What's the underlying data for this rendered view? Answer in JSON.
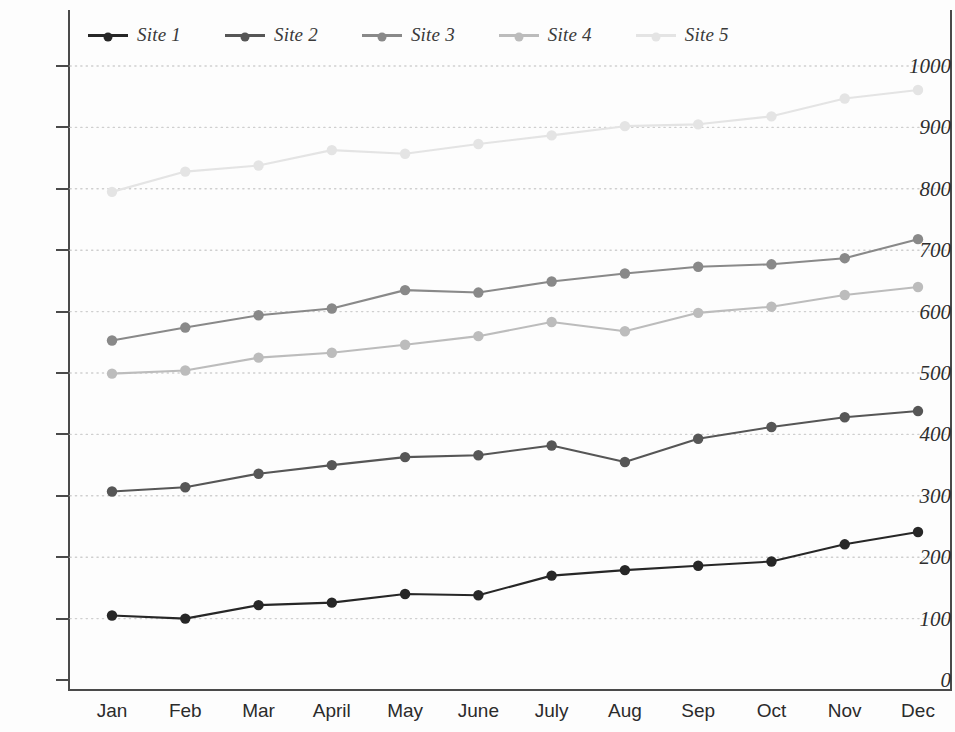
{
  "chart_data": {
    "type": "line",
    "title": "",
    "subtitle": "",
    "xlabel": "",
    "ylabel": "",
    "categories": [
      "Jan",
      "Feb",
      "Mar",
      "April",
      "May",
      "June",
      "July",
      "Aug",
      "Sep",
      "Oct",
      "Nov",
      "Dec"
    ],
    "ylim": [
      0,
      1000
    ],
    "ytick_values": [
      0,
      100,
      200,
      300,
      400,
      500,
      600,
      700,
      800,
      900,
      1000
    ],
    "ytick_labels": [
      "0",
      "100",
      "200",
      "300",
      "400",
      "500",
      "600",
      "700",
      "800",
      "900",
      "1000"
    ],
    "grid": true,
    "grid_style": "dotted-horizontal",
    "legend_position": "top",
    "markers": "filled-circle",
    "series": [
      {
        "name": "Site 1",
        "color": "#272727",
        "values": [
          105,
          100,
          122,
          126,
          140,
          138,
          170,
          179,
          186,
          193,
          221,
          241
        ]
      },
      {
        "name": "Site 2",
        "color": "#565656",
        "values": [
          307,
          314,
          336,
          350,
          363,
          366,
          382,
          355,
          393,
          412,
          428,
          438
        ]
      },
      {
        "name": "Site 3",
        "color": "#898989",
        "values": [
          553,
          574,
          594,
          605,
          635,
          631,
          649,
          662,
          673,
          677,
          687,
          718
        ]
      },
      {
        "name": "Site 4",
        "color": "#bcbcbc",
        "values": [
          499,
          504,
          525,
          533,
          546,
          560,
          583,
          568,
          598,
          608,
          627,
          640
        ]
      },
      {
        "name": "Site 5",
        "color": "#e4e4e4",
        "values": [
          795,
          828,
          838,
          863,
          857,
          873,
          887,
          902,
          905,
          918,
          947,
          961
        ]
      }
    ]
  },
  "legend": {
    "items": [
      {
        "label": "Site 1"
      },
      {
        "label": "Site 2"
      },
      {
        "label": "Site 3"
      },
      {
        "label": "Site 4"
      },
      {
        "label": "Site 5"
      }
    ]
  },
  "colors": {
    "axis": "#4a4a4a",
    "grid": "#cfcfcf",
    "background": "#fdfdfd",
    "tick_text": "#2e2e2e"
  }
}
